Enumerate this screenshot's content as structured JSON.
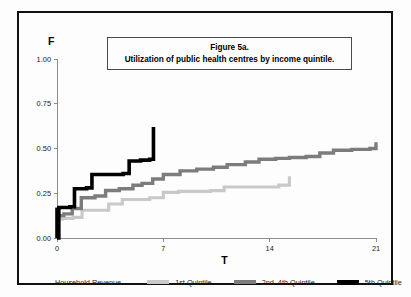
{
  "figure": {
    "title_line1": "Figure 5a.",
    "title_line2": "Utilization of public health centres by income quintile."
  },
  "legend": {
    "heading": "Household Revenue",
    "entries": [
      {
        "label": "1st Quintile",
        "color": "#c9c9c9"
      },
      {
        "label": "2nd–4th Quintile",
        "color": "#7c7c7c"
      },
      {
        "label": "5th Quintile",
        "color": "#000000"
      }
    ]
  },
  "chart_data": {
    "type": "line",
    "title": "Figure 5a. Utilization of public health centres by income quintile.",
    "xlabel": "T",
    "ylabel": "F",
    "xlim": [
      0,
      21
    ],
    "ylim": [
      0,
      1.0
    ],
    "xticks": [
      0,
      7,
      14,
      21
    ],
    "xtick_labels": [
      "0",
      "7",
      "14",
      "21"
    ],
    "yticks": [
      0.0,
      0.25,
      0.5,
      0.75,
      1.0
    ],
    "ytick_labels": [
      "0.00",
      "0.25",
      "0.50",
      "0.75",
      "1.00"
    ],
    "grid": false,
    "legend_position": "below",
    "interpolation": "step-post",
    "series": [
      {
        "name": "1st Quintile",
        "color": "#c9c9c9",
        "width": 3.2,
        "x": [
          0.0,
          0.35,
          1.05,
          1.65,
          2.5,
          3.4,
          4.3,
          5.3,
          6.1,
          7.0,
          8.0,
          10.1,
          11.0,
          14.6,
          15.3
        ],
        "y": [
          0.105,
          0.11,
          0.115,
          0.155,
          0.155,
          0.19,
          0.215,
          0.215,
          0.225,
          0.255,
          0.26,
          0.265,
          0.285,
          0.295,
          0.345
        ]
      },
      {
        "name": "2nd-4th Quintile",
        "color": "#7c7c7c",
        "width": 3.4,
        "x": [
          0.0,
          0.45,
          1.0,
          1.6,
          2.5,
          3.2,
          4.1,
          5.0,
          5.6,
          6.3,
          7.0,
          8.1,
          9.2,
          10.3,
          11.2,
          12.4,
          13.3,
          14.4,
          15.3,
          16.4,
          17.3,
          18.2,
          19.4,
          20.6,
          21.0
        ],
        "y": [
          0.125,
          0.135,
          0.165,
          0.225,
          0.235,
          0.265,
          0.275,
          0.295,
          0.305,
          0.33,
          0.355,
          0.375,
          0.385,
          0.395,
          0.41,
          0.425,
          0.44,
          0.445,
          0.45,
          0.455,
          0.475,
          0.49,
          0.495,
          0.5,
          0.535
        ]
      },
      {
        "name": "5th Quintile",
        "color": "#000000",
        "width": 3.6,
        "x": [
          0.0,
          0.12,
          0.85,
          1.15,
          1.95,
          2.3,
          4.35,
          4.75,
          5.5,
          6.1,
          6.35
        ],
        "y": [
          0.0,
          0.17,
          0.175,
          0.275,
          0.28,
          0.355,
          0.36,
          0.43,
          0.435,
          0.44,
          0.62
        ]
      }
    ]
  }
}
